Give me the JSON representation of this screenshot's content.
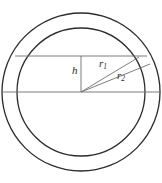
{
  "figure": {
    "type": "geometric-diagram",
    "background_color": "#ffffff",
    "stroke_color": "#2b2b2b",
    "thin_stroke_color": "#6e6e6e",
    "labels": {
      "height_segment": "h",
      "inner_radius": "r",
      "inner_radius_subscript": "1",
      "outer_radius": "r",
      "outer_radius_subscript": "2"
    },
    "geometry": {
      "center_x": 81,
      "center_y": 92,
      "outer_circle_radius": 79,
      "inner_circle_radius": 64,
      "chord_y": 56,
      "chord_left_x": 15,
      "chord_right_x": 147,
      "diameter_y": 92,
      "diameter_left_x": 2,
      "diameter_right_x": 160,
      "height_segment_x": 81,
      "height_segment_top_y": 56,
      "height_segment_bottom_y": 92,
      "radius_inner_end_x": 139,
      "radius_inner_end_y": 57,
      "radius_outer_end_x": 150,
      "radius_outer_end_y": 64
    }
  }
}
